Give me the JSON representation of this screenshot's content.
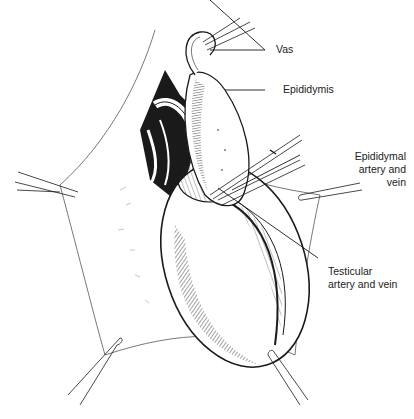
{
  "figure": {
    "colors": {
      "ink": "#1a1a1a",
      "paper": "#ffffff",
      "label_text": "#222222"
    }
  },
  "labels": {
    "vas": "Vas",
    "epididymis": "Epididymis",
    "epididymal_artery_line1": "Epididymal",
    "epididymal_artery_line2": "artery and",
    "epididymal_artery_line3": "vein",
    "testicular_artery_line1": "Testicular",
    "testicular_artery_line2": "artery and vein"
  },
  "instruments": [
    {
      "name": "clamp-upper-vas",
      "position": "top-center"
    },
    {
      "name": "clamp-left",
      "position": "left"
    },
    {
      "name": "clamp-right",
      "position": "right"
    },
    {
      "name": "clamp-bottom-left",
      "position": "bottom-left"
    },
    {
      "name": "clamp-bottom-right",
      "position": "bottom-right"
    },
    {
      "name": "forceps-vessels",
      "position": "center-right"
    }
  ]
}
